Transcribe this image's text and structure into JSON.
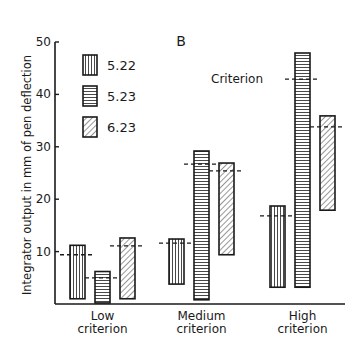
{
  "chart_data": {
    "type": "bar",
    "subtype": "floating-range-bar",
    "title": "B",
    "xlabel": "",
    "ylabel": "Integrator output in mm of pen deflection",
    "ylim": [
      0,
      50
    ],
    "yticks": [
      10,
      20,
      30,
      40,
      50
    ],
    "grid": false,
    "legend_position": "top-left",
    "categories": [
      "Low\ncriterion",
      "Medium\ncriterion",
      "High\ncriterion"
    ],
    "category_lines": [
      [
        "Low",
        "criterion"
      ],
      [
        "Medium",
        "criterion"
      ],
      [
        "High",
        "criterion"
      ]
    ],
    "series": [
      {
        "name": "5.22",
        "pattern": "vertical-hatch",
        "ranges": [
          [
            1.0,
            11.2
          ],
          [
            3.8,
            12.4
          ],
          [
            3.2,
            18.7
          ]
        ],
        "criterion": [
          9.4,
          11.6,
          16.8
        ]
      },
      {
        "name": "5.23",
        "pattern": "horizontal-hatch",
        "ranges": [
          [
            0.2,
            6.2
          ],
          [
            0.8,
            29.2
          ],
          [
            3.2,
            47.9
          ]
        ],
        "criterion": [
          5.0,
          26.7,
          42.9
        ]
      },
      {
        "name": "6.23",
        "pattern": "diagonal-hatch",
        "ranges": [
          [
            1.0,
            12.6
          ],
          [
            9.4,
            26.9
          ],
          [
            17.9,
            35.9
          ]
        ],
        "criterion": [
          11.1,
          25.4,
          33.8
        ]
      }
    ],
    "annotations": [
      {
        "text": "Criterion",
        "series": 1,
        "category": 2,
        "description": "dashed line marks criterion level"
      }
    ]
  },
  "colors": {
    "ink": "#1a1a1a",
    "background": "#ffffff"
  }
}
